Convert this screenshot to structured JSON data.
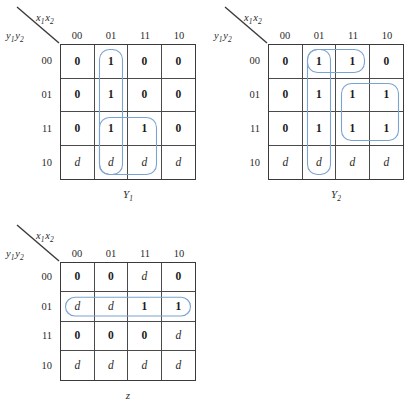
{
  "figure": {
    "type": "karnaugh-map-set",
    "colors": {
      "loop_stroke": "#7ba3d0",
      "grid_line": "#4a4a4a",
      "text": "#1b1b1b",
      "background": "#ffffff"
    },
    "column_variable_label": "x₁x₂",
    "row_variable_label": "y₁y₂",
    "column_headers": [
      "00",
      "01",
      "11",
      "10"
    ],
    "row_headers": [
      "00",
      "01",
      "11",
      "10"
    ]
  },
  "maps": [
    {
      "id": "Y1",
      "caption": "Y",
      "caption_sub": "1",
      "col_var": "x",
      "col_var_sub1": "1",
      "col_var2": "x",
      "col_var_sub2": "2",
      "row_var": "y",
      "row_var_sub1": "1",
      "row_var2": "y",
      "row_var_sub2": "2",
      "columns": [
        "00",
        "01",
        "11",
        "10"
      ],
      "rows": [
        "00",
        "01",
        "11",
        "10"
      ],
      "cells": [
        [
          "0",
          "1",
          "0",
          "0"
        ],
        [
          "0",
          "1",
          "0",
          "0"
        ],
        [
          "0",
          "1",
          "1",
          "0"
        ],
        [
          "d",
          "d",
          "d",
          "d"
        ]
      ],
      "groups": [
        {
          "name": "group-column-01",
          "row_start": 0,
          "row_end": 3,
          "col_start": 1,
          "col_end": 1
        },
        {
          "name": "group-rows-11-10-cols-01-11",
          "row_start": 2,
          "row_end": 3,
          "col_start": 1,
          "col_end": 2
        }
      ]
    },
    {
      "id": "Y2",
      "caption": "Y",
      "caption_sub": "2",
      "col_var": "x",
      "col_var_sub1": "1",
      "col_var2": "x",
      "col_var_sub2": "2",
      "row_var": "y",
      "row_var_sub1": "1",
      "row_var2": "y",
      "row_var_sub2": "2",
      "columns": [
        "00",
        "01",
        "11",
        "10"
      ],
      "rows": [
        "00",
        "01",
        "11",
        "10"
      ],
      "cells": [
        [
          "0",
          "1",
          "1",
          "0"
        ],
        [
          "0",
          "1",
          "1",
          "1"
        ],
        [
          "0",
          "1",
          "1",
          "1"
        ],
        [
          "d",
          "d",
          "d",
          "d"
        ]
      ],
      "groups": [
        {
          "name": "group-column-01",
          "row_start": 0,
          "row_end": 3,
          "col_start": 1,
          "col_end": 1
        },
        {
          "name": "group-row-00-cols-01-11",
          "row_start": 0,
          "row_end": 0,
          "col_start": 1,
          "col_end": 2
        },
        {
          "name": "group-rows-01-11-cols-11-10",
          "row_start": 1,
          "row_end": 2,
          "col_start": 2,
          "col_end": 3
        }
      ]
    },
    {
      "id": "z",
      "caption": "z",
      "caption_sub": "",
      "col_var": "x",
      "col_var_sub1": "1",
      "col_var2": "x",
      "col_var_sub2": "2",
      "row_var": "y",
      "row_var_sub1": "1",
      "row_var2": "y",
      "row_var_sub2": "2",
      "columns": [
        "00",
        "01",
        "11",
        "10"
      ],
      "rows": [
        "00",
        "01",
        "11",
        "10"
      ],
      "cells": [
        [
          "0",
          "0",
          "d",
          "0"
        ],
        [
          "d",
          "d",
          "1",
          "1"
        ],
        [
          "0",
          "0",
          "0",
          "d"
        ],
        [
          "d",
          "d",
          "d",
          "d"
        ]
      ],
      "groups": [
        {
          "name": "group-row-01-all-cols",
          "row_start": 1,
          "row_end": 1,
          "col_start": 0,
          "col_end": 3
        }
      ]
    }
  ]
}
